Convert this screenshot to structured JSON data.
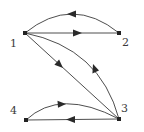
{
  "diagram": {
    "type": "directed-graph",
    "colors": {
      "edge": "#3a3a3a",
      "node": "#222222",
      "label": "#3a3a3a",
      "background": "#ffffff"
    },
    "nodes": [
      {
        "id": "1",
        "label": "1",
        "x": 25,
        "y": 33
      },
      {
        "id": "2",
        "label": "2",
        "x": 119,
        "y": 33
      },
      {
        "id": "3",
        "label": "3",
        "x": 119,
        "y": 119
      },
      {
        "id": "4",
        "label": "4",
        "x": 26,
        "y": 120
      }
    ],
    "edges": [
      {
        "from": "2",
        "to": "1",
        "shape": "curved"
      },
      {
        "from": "1",
        "to": "2",
        "shape": "straight"
      },
      {
        "from": "1",
        "to": "3",
        "shape": "straight"
      },
      {
        "from": "3",
        "to": "1",
        "shape": "curved"
      },
      {
        "from": "4",
        "to": "3",
        "shape": "curved"
      },
      {
        "from": "3",
        "to": "4",
        "shape": "straight"
      }
    ]
  }
}
